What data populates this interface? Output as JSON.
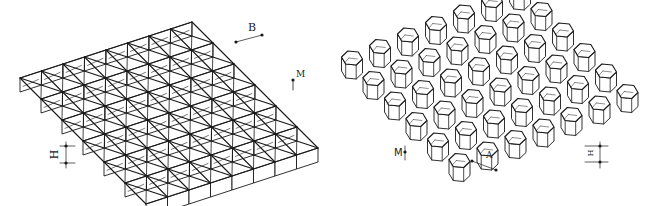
{
  "figures": [
    {
      "id": "triangular-core",
      "description": "Triangular cell structure, isometric view",
      "labels": {
        "cell_width": "B",
        "wall_thickness": "M",
        "cell_height": "H"
      },
      "grid": {
        "rows": 6,
        "cols": 8
      }
    },
    {
      "id": "hexagonal-core",
      "description": "Hexagonal honeycomb cell structure, isometric view",
      "labels": {
        "wall_thickness": "M",
        "cell_side": "A",
        "cell_height": "H"
      },
      "grid": {
        "rows": 6,
        "cols": 7
      }
    }
  ],
  "colors": {
    "line": "#1a1a1a",
    "background": "#ffffff"
  }
}
